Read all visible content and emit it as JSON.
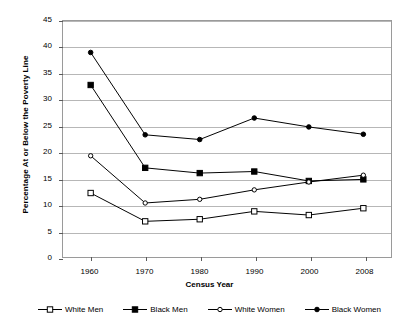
{
  "chart_data": {
    "type": "line",
    "title": "",
    "xlabel": "Census Year",
    "ylabel": "Percentage At or Below the Poverty Line",
    "categories": [
      "1960",
      "1970",
      "1980",
      "1990",
      "2000",
      "2008"
    ],
    "ylim": [
      0,
      45
    ],
    "yticks": [
      0,
      5,
      10,
      15,
      20,
      25,
      30,
      35,
      40,
      45
    ],
    "ytick_labels": [
      "0",
      "5",
      "10",
      "15",
      "20",
      "25",
      "30",
      "35",
      "40",
      "45"
    ],
    "grid": "horizontal",
    "legend_position": "bottom",
    "series": [
      {
        "name": "White Men",
        "marker": "open-square",
        "color": "#000000",
        "values": [
          12.2,
          6.8,
          7.2,
          8.7,
          8.0,
          9.3
        ]
      },
      {
        "name": "Black Men",
        "marker": "filled-square",
        "color": "#000000",
        "values": [
          32.8,
          17.0,
          16.0,
          16.3,
          14.5,
          14.8
        ]
      },
      {
        "name": "White Women",
        "marker": "open-circle",
        "color": "#000000",
        "values": [
          19.3,
          10.3,
          11.0,
          12.8,
          14.3,
          15.6
        ]
      },
      {
        "name": "Black Women",
        "marker": "filled-circle",
        "color": "#000000",
        "values": [
          39.0,
          23.3,
          22.4,
          26.5,
          24.8,
          23.4
        ]
      }
    ]
  },
  "axis": {
    "y_title": "Percentage At or Below the Poverty Line",
    "x_title": "Census Year"
  },
  "legend": {
    "items": [
      {
        "label": "White Men"
      },
      {
        "label": "Black Men"
      },
      {
        "label": "White Women"
      },
      {
        "label": "Black Women"
      }
    ]
  }
}
